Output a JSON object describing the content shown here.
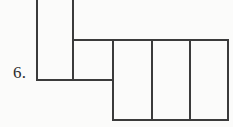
{
  "figure": {
    "item_number_label": "6.",
    "caption": "",
    "background_color": "#fbfbfa",
    "line_color": "#3b3b3b",
    "line_width_px": 2,
    "canvas": {
      "width": 233,
      "height": 127
    },
    "parts": [
      {
        "name": "top-tall-rectangle",
        "label": "",
        "x": 36,
        "y": -14,
        "width": 37,
        "height": 94,
        "note": "cropped at top edge of image"
      },
      {
        "name": "middle-square",
        "label": "",
        "x": 73,
        "y": 40,
        "width": 40,
        "height": 40
      },
      {
        "name": "right-rectangle-1",
        "label": "",
        "x": 113,
        "y": 40,
        "width": 39,
        "height": 80
      },
      {
        "name": "right-rectangle-2",
        "label": "",
        "x": 152,
        "y": 40,
        "width": 38,
        "height": 80
      },
      {
        "name": "right-rectangle-3",
        "label": "",
        "x": 190,
        "y": 40,
        "width": 38,
        "height": 80
      }
    ],
    "segments": [
      {
        "name": "left-vertical-edge",
        "x1": 37,
        "y1": 0,
        "x2": 37,
        "y2": 80
      },
      {
        "name": "inner-vertical-divider",
        "x1": 73,
        "y1": 0,
        "x2": 73,
        "y2": 80
      },
      {
        "name": "middle-top-horizontal",
        "x1": 73,
        "y1": 40,
        "x2": 228,
        "y2": 40
      },
      {
        "name": "middle-bottom-horizontal",
        "x1": 36,
        "y1": 80,
        "x2": 113,
        "y2": 80
      },
      {
        "name": "right-vertical-divider-1",
        "x1": 113,
        "y1": 40,
        "x2": 113,
        "y2": 120
      },
      {
        "name": "right-vertical-divider-2",
        "x1": 152,
        "y1": 40,
        "x2": 152,
        "y2": 120
      },
      {
        "name": "right-vertical-divider-3",
        "x1": 190,
        "y1": 40,
        "x2": 190,
        "y2": 120
      },
      {
        "name": "right-outer-vertical-edge",
        "x1": 228,
        "y1": 40,
        "x2": 228,
        "y2": 120
      },
      {
        "name": "bottom-horizontal",
        "x1": 113,
        "y1": 120,
        "x2": 228,
        "y2": 120
      }
    ]
  }
}
